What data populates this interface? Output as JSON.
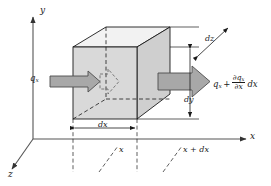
{
  "figure": {
    "kind": "heat-conduction-control-volume",
    "background": "#ffffff",
    "line_color": "#1a1a1a",
    "cube_face_color": "#d9d9d9",
    "cube_top_color": "#ffffff",
    "cube_side_color": "#c9c9c9",
    "arrow_fill": "#a8a8a8",
    "arrow_stroke": "#4d4d4d",
    "axis_color": "#555555"
  },
  "axes": {
    "y_label": "y",
    "x_label": "x",
    "z_label": "z"
  },
  "flux": {
    "in_label": "q",
    "in_sub": "x",
    "out_label": "q",
    "out_sub": "x",
    "out_plus": "+",
    "out_num": "∂q",
    "out_num_sub": "x",
    "out_den": "∂x",
    "out_tail": "dx"
  },
  "dimensions": {
    "dx": "dx",
    "dy": "dy",
    "dz": "dz"
  },
  "positions": {
    "x_tick_label": "x",
    "x_plus_dx_label": "x + dx"
  }
}
